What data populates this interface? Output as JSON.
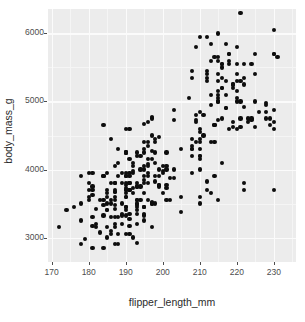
{
  "chart_data": {
    "type": "scatter",
    "title": "",
    "xlabel": "flipper_length_mm",
    "ylabel": "body_mass_g",
    "xlim": [
      169,
      236
    ],
    "ylim": [
      2640,
      6360
    ],
    "xticks": [
      170,
      180,
      190,
      200,
      210,
      220,
      230
    ],
    "xtick_labels": [
      "170",
      "180",
      "190",
      "200",
      "210",
      "220",
      "230"
    ],
    "yticks": [
      3000,
      4000,
      5000,
      6000
    ],
    "ytick_labels": [
      "3000",
      "4000",
      "5000",
      "6000"
    ],
    "x_minor_ticks": [
      175,
      185,
      195,
      205,
      215,
      225,
      235
    ],
    "y_minor_ticks": [
      2500,
      3500,
      4500,
      5500
    ],
    "grid": true,
    "legend": "none",
    "point_color": "#0d0d0d",
    "panel_background": "#ececec",
    "grid_color": "#fbfbfb",
    "n_points": 342,
    "x": [
      181,
      186,
      195,
      193,
      190,
      181,
      195,
      193,
      190,
      186,
      180,
      182,
      191,
      198,
      185,
      195,
      197,
      184,
      194,
      174,
      180,
      189,
      185,
      180,
      187,
      183,
      187,
      172,
      180,
      178,
      178,
      188,
      184,
      195,
      196,
      190,
      180,
      181,
      184,
      182,
      195,
      186,
      196,
      185,
      190,
      182,
      179,
      190,
      191,
      186,
      188,
      190,
      200,
      187,
      191,
      186,
      193,
      181,
      194,
      185,
      195,
      185,
      192,
      184,
      192,
      195,
      188,
      190,
      198,
      190,
      190,
      196,
      197,
      190,
      195,
      191,
      184,
      187,
      195,
      189,
      196,
      187,
      193,
      191,
      194,
      190,
      189,
      189,
      190,
      202,
      205,
      185,
      186,
      187,
      208,
      190,
      196,
      178,
      192,
      192,
      203,
      183,
      190,
      193,
      184,
      199,
      190,
      181,
      197,
      198,
      191,
      193,
      197,
      191,
      196,
      188,
      199,
      189,
      189,
      187,
      198,
      176,
      202,
      186,
      199,
      191,
      195,
      191,
      210,
      190,
      197,
      193,
      199,
      187,
      190,
      191,
      200,
      185,
      193,
      193,
      187,
      188,
      190,
      192,
      185,
      190,
      184,
      195,
      193,
      187,
      201,
      211,
      230,
      210,
      218,
      215,
      210,
      211,
      219,
      209,
      215,
      214,
      216,
      214,
      213,
      210,
      217,
      210,
      221,
      209,
      222,
      218,
      215,
      213,
      215,
      215,
      215,
      216,
      215,
      210,
      220,
      222,
      209,
      207,
      230,
      220,
      220,
      213,
      219,
      208,
      208,
      208,
      225,
      210,
      216,
      222,
      217,
      210,
      225,
      213,
      215,
      210,
      220,
      210,
      225,
      217,
      220,
      208,
      220,
      208,
      224,
      208,
      221,
      214,
      231,
      219,
      230,
      229,
      220,
      223,
      216,
      221,
      221,
      217,
      216,
      230,
      209,
      220,
      215,
      223,
      212,
      221,
      212,
      224,
      212,
      228,
      218,
      218,
      212,
      230,
      218,
      228,
      212,
      224,
      214,
      226,
      216,
      222,
      203,
      225,
      219,
      228,
      215,
      228,
      216,
      215,
      210,
      219,
      208,
      209,
      216,
      229,
      213,
      230,
      217,
      230,
      222,
      214,
      215,
      222,
      212,
      213,
      192,
      196,
      193,
      188,
      197,
      198,
      178,
      197,
      195,
      198,
      193,
      194,
      185,
      201,
      190,
      201,
      197,
      181,
      190,
      195,
      181,
      191,
      187,
      193,
      195,
      197,
      200,
      200,
      191,
      205,
      187,
      201,
      187,
      203,
      195,
      199,
      195,
      210,
      192,
      205,
      210,
      187,
      196,
      196,
      196,
      201,
      190,
      212,
      187,
      198,
      199,
      201,
      193,
      203,
      187,
      197,
      191,
      203,
      202,
      194
    ],
    "y": [
      3750,
      3800,
      3250,
      3450,
      3650,
      3625,
      4675,
      3475,
      4250,
      3300,
      3700,
      3200,
      3800,
      4400,
      3700,
      3450,
      4500,
      3325,
      4200,
      3400,
      3600,
      3800,
      3950,
      3800,
      3800,
      3550,
      3200,
      3150,
      3950,
      3250,
      3900,
      3300,
      3900,
      3325,
      4150,
      3950,
      3550,
      3300,
      4650,
      3150,
      3900,
      3100,
      4400,
      3000,
      4600,
      3425,
      2975,
      3450,
      4150,
      3500,
      4300,
      3450,
      4050,
      2900,
      3700,
      3550,
      3800,
      2850,
      3750,
      3150,
      4400,
      3600,
      4050,
      2850,
      3950,
      3350,
      4100,
      3050,
      4450,
      3600,
      3900,
      3550,
      4150,
      3700,
      4250,
      3700,
      3900,
      3550,
      4000,
      3200,
      4700,
      3800,
      4200,
      3350,
      3550,
      3800,
      3500,
      3950,
      3600,
      3550,
      4300,
      3400,
      4450,
      3300,
      4300,
      3700,
      4350,
      2900,
      4100,
      3725,
      4725,
      3075,
      4250,
      2925,
      3550,
      3750,
      3900,
      3175,
      4775,
      3825,
      4600,
      3200,
      4275,
      3900,
      4075,
      2900,
      3775,
      3350,
      3325,
      3150,
      3500,
      3450,
      3875,
      3050,
      4000,
      3275,
      4300,
      3050,
      4000,
      3325,
      3500,
      3500,
      4475,
      3425,
      3900,
      3175,
      3975,
      3400,
      4250,
      3400,
      3475,
      3050,
      3725,
      3000,
      3650,
      4250,
      3475,
      3450,
      3750,
      3700,
      4000,
      4500,
      5700,
      4450,
      5700,
      5400,
      4550,
      4800,
      5200,
      4400,
      5150,
      4650,
      5550,
      4650,
      5850,
      4200,
      5850,
      4150,
      6300,
      4800,
      5350,
      5700,
      5000,
      4400,
      5050,
      5000,
      5100,
      4100,
      5650,
      4600,
      5550,
      5250,
      4700,
      5050,
      6050,
      5150,
      5400,
      4950,
      5250,
      4350,
      5350,
      3950,
      5700,
      4300,
      4750,
      5550,
      4900,
      4200,
      5400,
      5100,
      5300,
      4850,
      5300,
      4400,
      5000,
      4900,
      5050,
      4300,
      5000,
      4450,
      5550,
      4200,
      5300,
      4400,
      5650,
      4700,
      5700,
      4650,
      5800,
      4700,
      5550,
      4750,
      5000,
      5100,
      5200,
      4700,
      5800,
      4600,
      6000,
      4750,
      5950,
      4625,
      5450,
      4725,
      5350,
      4750,
      5600,
      4600,
      5300,
      4875,
      5550,
      4950,
      5400,
      4750,
      5650,
      4850,
      5200,
      4925,
      4875,
      4625,
      5250,
      4850,
      5600,
      4975,
      5500,
      4725,
      5950,
      4625,
      5450,
      4725,
      5350,
      4750,
      5600,
      4600,
      5300,
      3700,
      3700,
      3900,
      3550,
      3800,
      3825,
      3650,
      3650,
      4050,
      3350,
      3900,
      3150,
      4250,
      3500,
      4750,
      3650,
      3900,
      3550,
      4000,
      3500,
      4050,
      3450,
      4250,
      3500,
      3950,
      3400,
      3800,
      3700,
      3800,
      3800,
      3750,
      4050,
      3525,
      3950,
      3650,
      3950,
      3600,
      4050,
      3550,
      3600,
      4000,
      3450,
      3900,
      3850,
      3500,
      3975,
      3375,
      3600,
      3675,
      3900,
      3800,
      3950,
      3725,
      3775,
      3700,
      3675,
      4100,
      3775,
      3775,
      3550,
      3875
    ]
  },
  "axis_titles": {
    "x": "flipper_length_mm",
    "y": "body_mass_g"
  }
}
